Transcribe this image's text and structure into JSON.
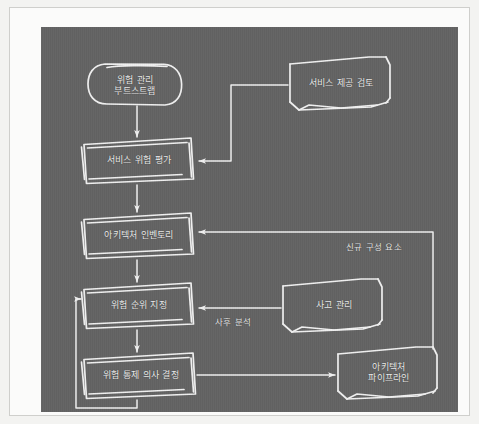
{
  "diagram": {
    "style": "hand-drawn whiteboard sketch",
    "canvas_color": "#636363",
    "stroke_color": "#f0f0f0",
    "frame_color": "#fbfbfa"
  },
  "nodes": [
    {
      "id": "bootstrap",
      "label": "위험 관리\n부트스트랩",
      "shape": "rounded-terminator",
      "column": "left",
      "order": 1
    },
    {
      "id": "svc-risk",
      "label": "서비스 위험 평가",
      "shape": "process-box",
      "column": "left",
      "order": 2
    },
    {
      "id": "arch-inv",
      "label": "아키텍처 인벤토리",
      "shape": "process-box",
      "column": "left",
      "order": 3
    },
    {
      "id": "risk-rank",
      "label": "위험 순위 지정",
      "shape": "process-box",
      "column": "left",
      "order": 4
    },
    {
      "id": "risk-ctrl",
      "label": "위험 통제 의사 결정",
      "shape": "process-box",
      "column": "left",
      "order": 5
    },
    {
      "id": "svc-review",
      "label": "서비스 제공 검토",
      "shape": "window-box",
      "column": "right",
      "order": 1
    },
    {
      "id": "incident",
      "label": "사고 관리",
      "shape": "window-box",
      "column": "right",
      "order": 2
    },
    {
      "id": "arch-pipe",
      "label": "아키텍처\n파이프라인",
      "shape": "window-box",
      "column": "right",
      "order": 3
    }
  ],
  "edges": [
    {
      "id": "e1",
      "from": "bootstrap",
      "to": "svc-risk",
      "label": ""
    },
    {
      "id": "e2",
      "from": "svc-risk",
      "to": "arch-inv",
      "label": ""
    },
    {
      "id": "e3",
      "from": "arch-inv",
      "to": "risk-rank",
      "label": ""
    },
    {
      "id": "e4",
      "from": "risk-rank",
      "to": "risk-ctrl",
      "label": ""
    },
    {
      "id": "e5",
      "from": "svc-review",
      "to": "svc-risk",
      "label": ""
    },
    {
      "id": "e6",
      "from": "incident",
      "to": "risk-rank",
      "label": "사후 분석"
    },
    {
      "id": "e7",
      "from": "arch-pipe",
      "to": "arch-inv",
      "label": "신규 구성 요소"
    },
    {
      "id": "e8",
      "from": "risk-ctrl",
      "to": "arch-pipe",
      "label": ""
    },
    {
      "id": "e9",
      "from": "risk-ctrl",
      "to": "risk-rank",
      "label": ""
    }
  ],
  "edge_labels": {
    "postmortem": "사후 분석",
    "new_components": "신규 구성 요소"
  }
}
